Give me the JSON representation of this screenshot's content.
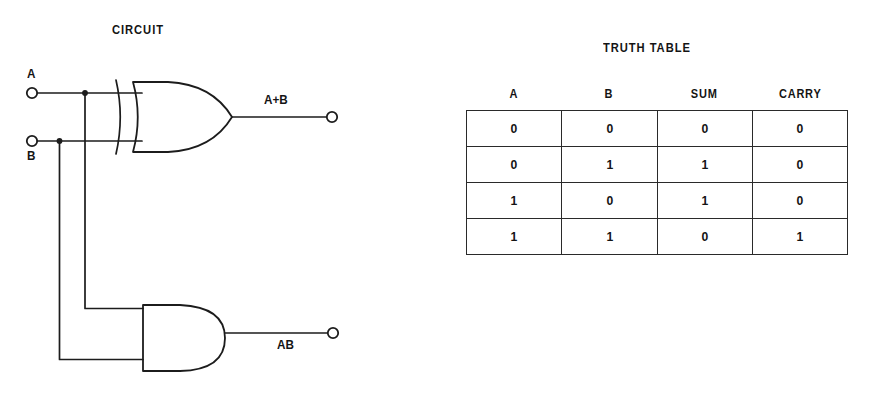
{
  "circuit": {
    "title": "CIRCUIT",
    "inputs": [
      {
        "name": "input-a",
        "label": "A"
      },
      {
        "name": "input-b",
        "label": "B"
      }
    ],
    "gates": [
      {
        "name": "xor-gate",
        "type": "xor",
        "output_label": "A+B"
      },
      {
        "name": "and-gate",
        "type": "and",
        "output_label": "AB"
      }
    ],
    "outputs": [
      {
        "name": "output-sum",
        "label": "A+B"
      },
      {
        "name": "output-carry",
        "label": "AB"
      }
    ],
    "stroke_color": "#1c1c1c"
  },
  "truth_table": {
    "title": "TRUTH TABLE",
    "columns": [
      "A",
      "B",
      "SUM",
      "CARRY"
    ],
    "rows": [
      [
        "0",
        "0",
        "0",
        "0"
      ],
      [
        "0",
        "1",
        "1",
        "0"
      ],
      [
        "1",
        "0",
        "1",
        "0"
      ],
      [
        "1",
        "1",
        "0",
        "1"
      ]
    ]
  }
}
